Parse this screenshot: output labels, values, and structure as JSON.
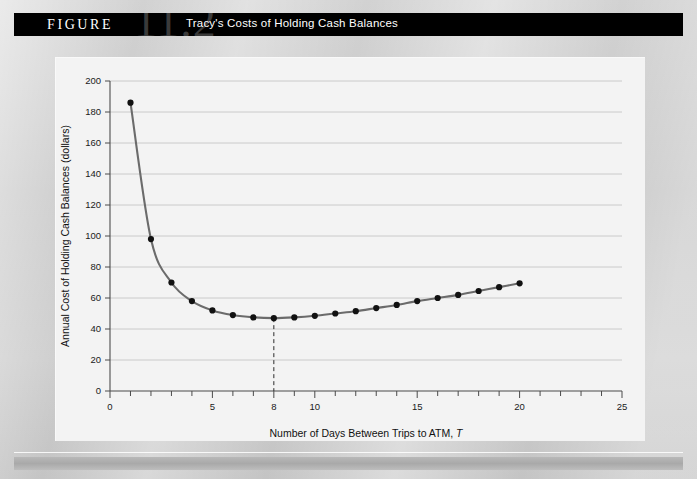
{
  "header": {
    "figure_word": "FIGURE",
    "figure_number": "11.2",
    "title": "Tracy's Costs of Holding Cash Balances"
  },
  "colors": {
    "header_bar": "#000000",
    "figure_number": "#3a3a3a",
    "panel_background": "#f3f3f3",
    "page_background": "#c9c9c9",
    "curve": "#6b6b6b",
    "marker": "#111111",
    "gridline": "#c6c6c6",
    "axis": "#4b4b4b"
  },
  "chart_data": {
    "type": "line",
    "title": "Tracy's Costs of Holding Cash Balances",
    "xlabel": "Number of Days Between Trips to ATM, T",
    "xlabel_plain": "Number of Days Between Trips to ATM,",
    "xlabel_italic": "T",
    "ylabel": "Annual Cost of Holding Cash Balances (dollars)",
    "xlim": [
      0,
      25
    ],
    "ylim": [
      0,
      200
    ],
    "xticks": [
      0,
      1,
      2,
      3,
      4,
      5,
      6,
      7,
      8,
      9,
      10,
      11,
      12,
      13,
      14,
      15,
      16,
      17,
      18,
      19,
      20,
      21,
      22,
      23,
      24,
      25
    ],
    "xtick_labels": [
      {
        "value": 0,
        "label": "0"
      },
      {
        "value": 5,
        "label": "5"
      },
      {
        "value": 8,
        "label": "8"
      },
      {
        "value": 10,
        "label": "10"
      },
      {
        "value": 15,
        "label": "15"
      },
      {
        "value": 20,
        "label": "20"
      },
      {
        "value": 25,
        "label": "25"
      }
    ],
    "yticks": [
      0,
      20,
      40,
      60,
      80,
      100,
      120,
      140,
      160,
      180,
      200
    ],
    "ytick_labels": [
      "0",
      "20",
      "40",
      "60",
      "80",
      "100",
      "120",
      "140",
      "160",
      "180",
      "200"
    ],
    "grid": "horizontal",
    "legend": "none",
    "x": [
      1,
      2,
      3,
      4,
      5,
      6,
      7,
      8,
      9,
      10,
      11,
      12,
      13,
      14,
      15,
      16,
      17,
      18,
      19,
      20
    ],
    "values": [
      186,
      98,
      70,
      58,
      52,
      49,
      47.5,
      47,
      47.5,
      48.5,
      50,
      51.5,
      53.5,
      55.5,
      58,
      60,
      62,
      64.5,
      67,
      69.5
    ],
    "series": [
      {
        "name": "Annual cost of holding cash balances",
        "values": [
          186,
          98,
          70,
          58,
          52,
          49,
          47.5,
          47,
          47.5,
          48.5,
          50,
          51.5,
          53.5,
          55.5,
          58,
          60,
          62,
          64.5,
          67,
          69.5
        ]
      }
    ],
    "annotations": [
      {
        "type": "vertical-dashed-line",
        "x": 8,
        "y_from": 0,
        "y_to": 47,
        "note": "cost-minimizing number of days between ATM trips"
      }
    ]
  }
}
